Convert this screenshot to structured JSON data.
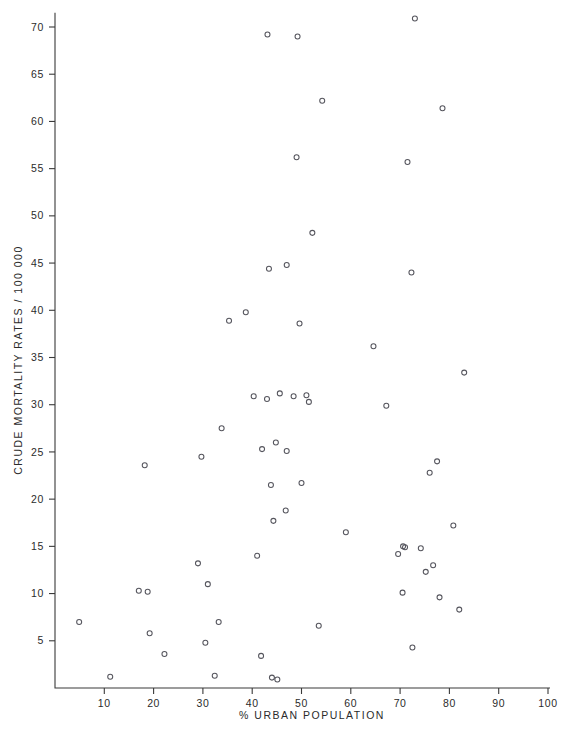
{
  "figure": {
    "background_color": "#ffffff",
    "marker_color": "#55555d",
    "axis_color": "#3a3a3a",
    "x_axis_title": "%  URBAN  POPULATION",
    "x_axis_title_prefix": "%",
    "x_axis_title_rest": "URBAN  POPULATION",
    "y_axis_title": "CRUDE MORTALITY RATES / 100 000"
  },
  "chart_data": {
    "type": "scatter",
    "title": "",
    "xlabel": "% URBAN POPULATION",
    "ylabel": "CRUDE MORTALITY RATES / 100 000",
    "xlim": [
      0,
      100
    ],
    "ylim": [
      0,
      71.5
    ],
    "grid": false,
    "legend": null,
    "marker_style": "open-circle",
    "xticks": [
      10,
      20,
      30,
      40,
      50,
      60,
      70,
      80,
      90,
      100
    ],
    "xtick_labels": [
      "10",
      "20",
      "30",
      "40",
      "50",
      "60",
      "70",
      "80",
      "90",
      "100"
    ],
    "yticks": [
      5,
      10,
      15,
      20,
      25,
      30,
      35,
      40,
      45,
      50,
      55,
      60,
      65,
      70
    ],
    "ytick_labels": [
      "5",
      "10",
      "15",
      "20",
      "25",
      "30",
      "35",
      "40",
      "45",
      "50",
      "55",
      "60",
      "65",
      "70"
    ],
    "n_points": 63,
    "points": [
      {
        "x": 4.9,
        "y": 7.0
      },
      {
        "x": 11.2,
        "y": 1.2
      },
      {
        "x": 17.0,
        "y": 10.3
      },
      {
        "x": 18.2,
        "y": 23.6
      },
      {
        "x": 18.8,
        "y": 10.2
      },
      {
        "x": 19.2,
        "y": 5.8
      },
      {
        "x": 22.2,
        "y": 3.6
      },
      {
        "x": 29.0,
        "y": 13.2
      },
      {
        "x": 29.7,
        "y": 24.5
      },
      {
        "x": 30.5,
        "y": 4.8
      },
      {
        "x": 31.0,
        "y": 11.0
      },
      {
        "x": 32.4,
        "y": 1.3
      },
      {
        "x": 33.2,
        "y": 7.0
      },
      {
        "x": 33.8,
        "y": 27.5
      },
      {
        "x": 35.3,
        "y": 38.9
      },
      {
        "x": 38.7,
        "y": 39.8
      },
      {
        "x": 40.3,
        "y": 30.9
      },
      {
        "x": 41.0,
        "y": 14.0
      },
      {
        "x": 41.8,
        "y": 3.4
      },
      {
        "x": 42.0,
        "y": 25.3
      },
      {
        "x": 43.0,
        "y": 30.6
      },
      {
        "x": 43.1,
        "y": 69.2
      },
      {
        "x": 43.4,
        "y": 44.4
      },
      {
        "x": 43.8,
        "y": 21.5
      },
      {
        "x": 44.0,
        "y": 1.1
      },
      {
        "x": 44.3,
        "y": 17.7
      },
      {
        "x": 44.8,
        "y": 26.0
      },
      {
        "x": 45.1,
        "y": 0.9
      },
      {
        "x": 45.6,
        "y": 31.2
      },
      {
        "x": 46.8,
        "y": 18.8
      },
      {
        "x": 47.0,
        "y": 25.1
      },
      {
        "x": 47.0,
        "y": 44.8
      },
      {
        "x": 48.4,
        "y": 30.9
      },
      {
        "x": 49.0,
        "y": 56.2
      },
      {
        "x": 49.2,
        "y": 69.0
      },
      {
        "x": 49.6,
        "y": 38.6
      },
      {
        "x": 50.0,
        "y": 21.7
      },
      {
        "x": 51.0,
        "y": 31.0
      },
      {
        "x": 51.5,
        "y": 30.3
      },
      {
        "x": 52.2,
        "y": 48.2
      },
      {
        "x": 53.5,
        "y": 6.6
      },
      {
        "x": 54.2,
        "y": 62.2
      },
      {
        "x": 59.0,
        "y": 16.5
      },
      {
        "x": 64.6,
        "y": 36.2
      },
      {
        "x": 67.2,
        "y": 29.9
      },
      {
        "x": 69.6,
        "y": 14.2
      },
      {
        "x": 70.5,
        "y": 10.1
      },
      {
        "x": 70.6,
        "y": 15.0
      },
      {
        "x": 71.0,
        "y": 14.9
      },
      {
        "x": 71.5,
        "y": 55.7
      },
      {
        "x": 72.3,
        "y": 44.0
      },
      {
        "x": 72.5,
        "y": 4.3
      },
      {
        "x": 73.0,
        "y": 70.9
      },
      {
        "x": 74.2,
        "y": 14.8
      },
      {
        "x": 75.2,
        "y": 12.3
      },
      {
        "x": 76.0,
        "y": 22.8
      },
      {
        "x": 76.7,
        "y": 13.0
      },
      {
        "x": 77.5,
        "y": 24.0
      },
      {
        "x": 78.0,
        "y": 9.6
      },
      {
        "x": 78.6,
        "y": 61.4
      },
      {
        "x": 80.8,
        "y": 17.2
      },
      {
        "x": 82.0,
        "y": 8.3
      },
      {
        "x": 83.0,
        "y": 33.4
      }
    ]
  }
}
